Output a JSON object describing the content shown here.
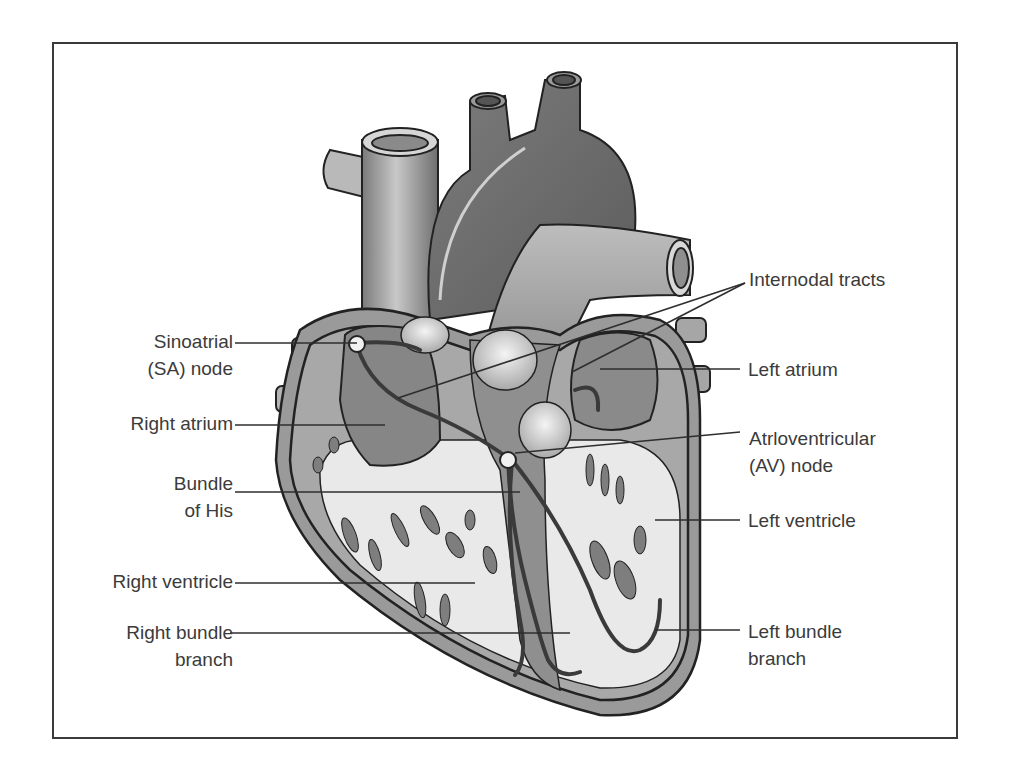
{
  "figure": {
    "colors": {
      "frame": "#3a3a3a",
      "text": "#3b3b3b",
      "muscle": "#8e8e8e",
      "dark_vessel": "#6a6a6a",
      "light_vessel": "#b0b0b0",
      "chamber_interior": "#e8e8e8",
      "conduction_path": "#4a4a4a"
    }
  },
  "labels": {
    "left": [
      {
        "id": "sa-node",
        "lines": [
          "Sinoatrial",
          "(SA) node"
        ]
      },
      {
        "id": "right-atrium",
        "lines": [
          "Right atrium"
        ]
      },
      {
        "id": "bundle-of-his",
        "lines": [
          "Bundle",
          "of His"
        ]
      },
      {
        "id": "right-ventricle",
        "lines": [
          "Right ventricle"
        ]
      },
      {
        "id": "right-bundle-branch",
        "lines": [
          "Right bundle",
          "branch"
        ]
      }
    ],
    "right": [
      {
        "id": "internodal-tracts",
        "lines": [
          "Internodal tracts"
        ]
      },
      {
        "id": "left-atrium",
        "lines": [
          "Left atrium"
        ]
      },
      {
        "id": "av-node",
        "lines": [
          "Atrloventricular",
          "(AV) node"
        ]
      },
      {
        "id": "left-ventricle",
        "lines": [
          "Left ventricle"
        ]
      },
      {
        "id": "left-bundle-branch",
        "lines": [
          "Left bundle",
          "branch"
        ]
      }
    ]
  }
}
